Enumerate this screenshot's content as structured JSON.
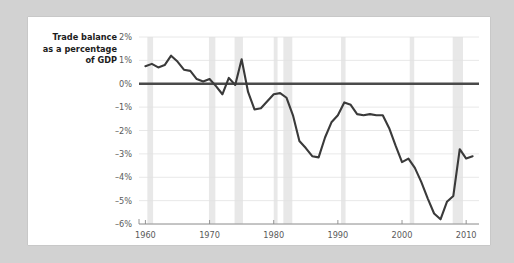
{
  "chart_data": {
    "type": "line",
    "title_lines": [
      "Trade balance",
      "as a percentage",
      "of GDP"
    ],
    "xlabel": "",
    "ylabel": "",
    "xlim": [
      1959,
      2012
    ],
    "ylim": [
      -6,
      2
    ],
    "grid": true,
    "legend": "none",
    "x_ticks": [
      1960,
      1970,
      1980,
      1990,
      2000,
      2010
    ],
    "x_tick_labels": [
      "1960",
      "1970",
      "1980",
      "1990",
      "2000",
      "2010"
    ],
    "y_ticks": [
      2,
      1,
      0,
      -1,
      -2,
      -3,
      -4,
      -5,
      -6
    ],
    "y_tick_labels": [
      "2%",
      "1%",
      "0%",
      "-1%",
      "-2%",
      "-3%",
      "-4%",
      "-5%",
      "-6%"
    ],
    "zero_reference_line": 0,
    "units": "percent of GDP",
    "series": [
      {
        "name": "Trade balance as a percentage of GDP",
        "color": "#3a3a3a",
        "x": [
          1960,
          1961,
          1962,
          1963,
          1964,
          1965,
          1966,
          1967,
          1968,
          1969,
          1970,
          1971,
          1972,
          1973,
          1974,
          1975,
          1976,
          1977,
          1978,
          1979,
          1980,
          1981,
          1982,
          1983,
          1984,
          1985,
          1986,
          1987,
          1988,
          1989,
          1990,
          1991,
          1992,
          1993,
          1994,
          1995,
          1996,
          1997,
          1998,
          1999,
          2000,
          2001,
          2002,
          2003,
          2004,
          2005,
          2006,
          2007,
          2008,
          2009,
          2010,
          2011
        ],
        "values": [
          0.75,
          0.85,
          0.7,
          0.8,
          1.2,
          0.95,
          0.6,
          0.55,
          0.2,
          0.1,
          0.2,
          -0.1,
          -0.45,
          0.25,
          -0.05,
          1.05,
          -0.35,
          -1.1,
          -1.05,
          -0.75,
          -0.45,
          -0.4,
          -0.6,
          -1.35,
          -2.45,
          -2.75,
          -3.1,
          -3.15,
          -2.3,
          -1.65,
          -1.35,
          -0.8,
          -0.9,
          -1.3,
          -1.35,
          -1.3,
          -1.35,
          -1.35,
          -1.9,
          -2.65,
          -3.35,
          -3.2,
          -3.6,
          -4.2,
          -4.9,
          -5.55,
          -5.8,
          -5.05,
          -4.8,
          -2.8,
          -3.2,
          -3.1
        ],
        "key_points": {
          "peak_1964": 1.2,
          "spike_1975": 1.05,
          "trough_1987": -3.15,
          "peak_1991": -0.8,
          "trough_2006": -5.8,
          "recovery_2009": -2.8,
          "final_2011": -3.1
        }
      }
    ],
    "recession_bands": [
      {
        "start": 1960.3,
        "end": 1961.2
      },
      {
        "start": 1969.9,
        "end": 1970.9
      },
      {
        "start": 1973.9,
        "end": 1975.2
      },
      {
        "start": 1980.0,
        "end": 1980.6
      },
      {
        "start": 1981.5,
        "end": 1982.9
      },
      {
        "start": 1990.5,
        "end": 1991.2
      },
      {
        "start": 2001.2,
        "end": 2001.9
      },
      {
        "start": 2007.9,
        "end": 2009.5
      }
    ],
    "colors": {
      "line": "#3a3a3a",
      "zero_line": "#4a4a4a",
      "gridline": "#e2e2e2",
      "recession_band": "#e8e8e8",
      "card_background": "#ffffff",
      "page_background": "#d2d2d2",
      "tick_text": "#5a5a5a",
      "title_text": "#1c1c1c"
    }
  }
}
